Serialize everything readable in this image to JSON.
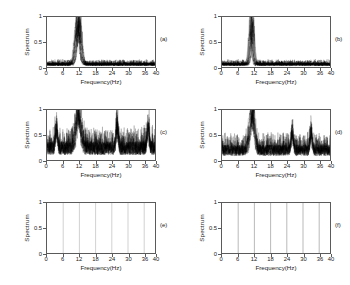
{
  "figure": {
    "background": "#ffffff",
    "axis_color": "#5a5a5a",
    "trace_color": "#000000",
    "grid_color": "#888888",
    "rows": 3,
    "cols": 2
  },
  "axes": {
    "xlabel": "Frequency(Hz)",
    "ylabel": "Spectrum",
    "xticks": [
      "0",
      "6",
      "12",
      "18",
      "24",
      "30",
      "36",
      "40"
    ],
    "xtick_values": [
      0,
      6,
      12,
      18,
      24,
      30,
      36,
      40
    ],
    "yticks": [
      "0",
      "0.5",
      "1"
    ],
    "ytick_values": [
      0,
      0.5,
      1
    ],
    "xlim": [
      0,
      40
    ],
    "ylim": [
      0,
      1
    ]
  },
  "panels": [
    {
      "id": "a",
      "label": "(a)"
    },
    {
      "id": "b",
      "label": "(b)"
    },
    {
      "id": "c",
      "label": "(c)"
    },
    {
      "id": "d",
      "label": "(d)"
    },
    {
      "id": "e",
      "label": "(e)"
    },
    {
      "id": "f",
      "label": "(f)"
    }
  ],
  "chart_data": [
    {
      "type": "line",
      "panel": "(a)",
      "title": "",
      "xlabel": "Frequency(Hz)",
      "ylabel": "Spectrum",
      "xlim": [
        0,
        40
      ],
      "ylim": [
        0,
        1
      ],
      "grid": false,
      "legend": "none",
      "description": "Dense bundle of overlapping spectrum traces with a single broad dominant peak near 11-12 Hz reaching 1.0 over a low noise floor near 0.05.",
      "noise_floor": 0.05,
      "peak_center_hz": 11.6,
      "peak_half_width_hz": 1.4,
      "peak_height": 1.0,
      "n_traces": 18,
      "secondary_peaks": []
    },
    {
      "type": "line",
      "panel": "(b)",
      "title": "",
      "xlabel": "Frequency(Hz)",
      "ylabel": "Spectrum",
      "xlim": [
        0,
        40
      ],
      "ylim": [
        0,
        1
      ],
      "grid": false,
      "legend": "none",
      "description": "Bundle of traces with a sharper, narrower dominant peak near 10.5-12 Hz reaching 1.0 over a low noise floor near 0.05.",
      "noise_floor": 0.05,
      "peak_center_hz": 11.0,
      "peak_half_width_hz": 0.9,
      "peak_height": 1.0,
      "n_traces": 18,
      "secondary_peaks": []
    },
    {
      "type": "line",
      "panel": "(c)",
      "title": "",
      "xlabel": "Frequency(Hz)",
      "ylabel": "Spectrum",
      "xlim": [
        0,
        40
      ],
      "ylim": [
        0,
        1
      ],
      "grid": false,
      "legend": "none",
      "description": "Heavily noisy spectra with broadband floor around 0.15-0.30, a dominant peak near 11-12 Hz reaching 1.0 and a secondary spike near 26 Hz around 0.6.",
      "noise_floor": 0.22,
      "peak_center_hz": 11.7,
      "peak_half_width_hz": 1.6,
      "peak_height": 1.0,
      "n_traces": 14,
      "secondary_peaks": [
        {
          "hz": 26.0,
          "height": 0.6
        },
        {
          "hz": 3.5,
          "height": 0.5
        },
        {
          "hz": 37.5,
          "height": 0.5
        }
      ]
    },
    {
      "type": "line",
      "panel": "(d)",
      "title": "",
      "xlabel": "Frequency(Hz)",
      "ylabel": "Spectrum",
      "xlim": [
        0,
        40
      ],
      "ylim": [
        0,
        1
      ],
      "grid": false,
      "legend": "none",
      "description": "Noisy spectra with broadband floor around 0.10-0.25, a dominant peak near 11 Hz reaching 1.0 and a secondary spike near 26 Hz around 0.5.",
      "noise_floor": 0.18,
      "peak_center_hz": 11.2,
      "peak_half_width_hz": 1.5,
      "peak_height": 1.0,
      "n_traces": 14,
      "secondary_peaks": [
        {
          "hz": 26.0,
          "height": 0.5
        },
        {
          "hz": 33.0,
          "height": 0.45
        }
      ]
    },
    {
      "type": "line",
      "panel": "(e)",
      "title": "",
      "xlabel": "Frequency(Hz)",
      "ylabel": "Spectrum",
      "xlim": [
        0,
        40
      ],
      "ylim": [
        0,
        1
      ],
      "grid": true,
      "legend": "none",
      "description": "Empty axes showing only faint vertical gridlines at 6, 12, 18, 24, 30 and 36 Hz; no spectrum trace is visible.",
      "noise_floor": 0,
      "peak_center_hz": null,
      "peak_height": 0,
      "n_traces": 0,
      "gridlines_hz": [
        6,
        12,
        18,
        24,
        30,
        36
      ],
      "secondary_peaks": []
    },
    {
      "type": "line",
      "panel": "(f)",
      "title": "",
      "xlabel": "Frequency(Hz)",
      "ylabel": "Spectrum",
      "xlim": [
        0,
        40
      ],
      "ylim": [
        0,
        1
      ],
      "grid": true,
      "legend": "none",
      "description": "Empty axes showing only vertical gridlines at 6, 12, 18, 24, 30 and 36 Hz, slightly darker than panel (e); no spectrum trace is visible.",
      "noise_floor": 0,
      "peak_center_hz": null,
      "peak_height": 0,
      "n_traces": 0,
      "gridlines_hz": [
        6,
        12,
        18,
        24,
        30,
        36
      ],
      "secondary_peaks": []
    }
  ]
}
